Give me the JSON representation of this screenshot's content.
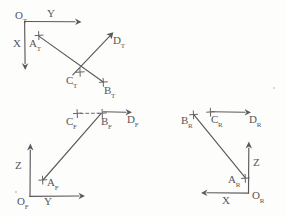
{
  "drawing": {
    "title": "Orthographic three-view point layout sketch",
    "style": "pencil sketch on white paper",
    "ink_color": "#5a5a5e",
    "paper_color": "#fdfdfc"
  },
  "views": [
    {
      "id": "top",
      "name": "Top view",
      "origin_label": "O",
      "origin_sub": "T",
      "axes": [
        {
          "name": "Y",
          "label": "Y",
          "direction": "right"
        },
        {
          "name": "X",
          "label": "X",
          "direction": "down"
        }
      ],
      "points": [
        {
          "label": "A",
          "sub": "T",
          "marker": "cross"
        },
        {
          "label": "B",
          "sub": "T",
          "marker": "cross"
        },
        {
          "label": "C",
          "sub": "T",
          "marker": "cross"
        },
        {
          "label": "D",
          "sub": "T",
          "marker": "arrow-tip"
        }
      ]
    },
    {
      "id": "front",
      "name": "Front view",
      "origin_label": "O",
      "origin_sub": "F",
      "axes": [
        {
          "name": "Y",
          "label": "Y",
          "direction": "right"
        },
        {
          "name": "Z",
          "label": "Z",
          "direction": "up"
        }
      ],
      "points": [
        {
          "label": "A",
          "sub": "F",
          "marker": "cross"
        },
        {
          "label": "B",
          "sub": "F",
          "marker": "cross"
        },
        {
          "label": "C",
          "sub": "F",
          "marker": "cross"
        },
        {
          "label": "D",
          "sub": "F",
          "marker": "arrow-tip"
        }
      ]
    },
    {
      "id": "right",
      "name": "Right view",
      "origin_label": "O",
      "origin_sub": "R",
      "axes": [
        {
          "name": "X",
          "label": "X",
          "direction": "left"
        },
        {
          "name": "Z",
          "label": "Z",
          "direction": "up"
        }
      ],
      "points": [
        {
          "label": "A",
          "sub": "R",
          "marker": "cross"
        },
        {
          "label": "B",
          "sub": "R",
          "marker": "cross"
        },
        {
          "label": "C",
          "sub": "R",
          "marker": "cross"
        },
        {
          "label": "D",
          "sub": "R",
          "marker": "arrow-tip"
        }
      ]
    }
  ],
  "labels": {
    "top": {
      "origin": "O",
      "origin_sub": "T",
      "axis_y": "Y",
      "axis_x": "X",
      "a": "A",
      "a_sub": "T",
      "b": "B",
      "b_sub": "T",
      "c": "C",
      "c_sub": "T",
      "d": "D",
      "d_sub": "T"
    },
    "front": {
      "origin": "O",
      "origin_sub": "F",
      "axis_y": "Y",
      "axis_z": "Z",
      "a": "A",
      "a_sub": "F",
      "b": "B",
      "b_sub": "F",
      "c": "C",
      "c_sub": "F",
      "d": "D",
      "d_sub": "F"
    },
    "right": {
      "origin": "O",
      "origin_sub": "R",
      "axis_x": "X",
      "axis_z": "Z",
      "a": "A",
      "a_sub": "R",
      "b": "B",
      "b_sub": "R",
      "c": "C",
      "c_sub": "R",
      "d": "D",
      "d_sub": "R"
    }
  }
}
